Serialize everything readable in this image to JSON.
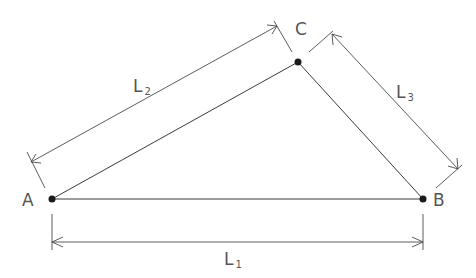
{
  "diagram": {
    "points": [
      {
        "id": "A",
        "label": "A",
        "x": 52,
        "y": 199
      },
      {
        "id": "B",
        "label": "B",
        "x": 423,
        "y": 199
      },
      {
        "id": "C",
        "label": "C",
        "x": 298,
        "y": 62
      }
    ],
    "dimensions": [
      {
        "id": "L1",
        "label": "L",
        "subscript": "1",
        "from": "A",
        "to": "B"
      },
      {
        "id": "L2",
        "label": "L",
        "subscript": "2",
        "from": "A",
        "to": "C"
      },
      {
        "id": "L3",
        "label": "L",
        "subscript": "3",
        "from": "C",
        "to": "B"
      }
    ],
    "colors": {
      "line": "#3a3a3a",
      "point": "#1a1a1a",
      "text": "#555555"
    }
  }
}
